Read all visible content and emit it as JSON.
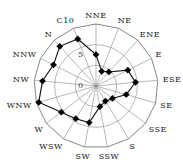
{
  "chart_data": {
    "type": "radar",
    "title": "",
    "categories": [
      "NNE",
      "NE",
      "ENE",
      "E",
      "ESE",
      "SE",
      "SSE",
      "S",
      "SSW",
      "SW",
      "WSW",
      "W",
      "WNW",
      "NW",
      "NNW",
      "N",
      "C"
    ],
    "axis_labels": [
      "NNE",
      "NE",
      "ENE",
      "E",
      "ESE",
      "SE",
      "SSE",
      "S",
      "SSW",
      "SW",
      "WSW",
      "W",
      "WNW",
      "NW",
      "NNW",
      "N",
      "C10"
    ],
    "series": [
      {
        "name": "series-1",
        "values": [
          2.6,
          -1.2,
          -0.4,
          3.6,
          4.6,
          2.6,
          0.0,
          -0.7,
          0.1,
          4.0,
          4.3,
          5.5,
          9.4,
          8.0,
          6.5,
          8.0,
          7.2
        ],
        "marker": "diamond",
        "color": "#000000"
      }
    ],
    "radial_ticks": [
      0,
      5,
      10
    ],
    "radial_tick_labels": [
      "0",
      "5",
      "10"
    ],
    "rlim": [
      -5,
      10
    ],
    "grid": true,
    "legend": "none"
  },
  "tick_labels": {
    "t0": "0",
    "t5": "5"
  }
}
